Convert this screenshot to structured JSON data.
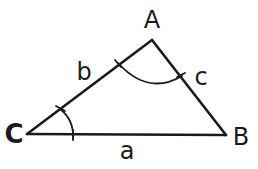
{
  "diagram": {
    "type": "triangle",
    "vertices": {
      "A": {
        "label": "A",
        "x": 152,
        "y": 40
      },
      "B": {
        "label": "B",
        "x": 226,
        "y": 135
      },
      "C": {
        "label": "C",
        "x": 27,
        "y": 134
      }
    },
    "sides": {
      "a": {
        "label": "a",
        "from": "C",
        "to": "B"
      },
      "b": {
        "label": "b",
        "from": "C",
        "to": "A"
      },
      "c": {
        "label": "c",
        "from": "A",
        "to": "B"
      }
    },
    "angle_marks": [
      {
        "vertex": "A",
        "type": "arc",
        "tick_marks": 2
      },
      {
        "vertex": "C",
        "type": "arc",
        "tick_marks": 2
      }
    ],
    "colors": {
      "stroke": "#1a1a1a",
      "background": "#ffffff"
    }
  }
}
